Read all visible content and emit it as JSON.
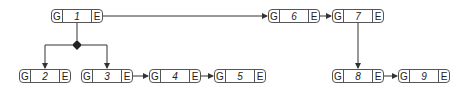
{
  "diagram": {
    "nodes": [
      {
        "id": "1",
        "label": "1",
        "left": "G",
        "right": "E",
        "x": 51,
        "y": 9
      },
      {
        "id": "2",
        "label": "2",
        "left": "G",
        "right": "E",
        "x": 19,
        "y": 69
      },
      {
        "id": "3",
        "label": "3",
        "left": "G",
        "right": "E",
        "x": 81,
        "y": 69
      },
      {
        "id": "4",
        "label": "4",
        "left": "G",
        "right": "E",
        "x": 149,
        "y": 69
      },
      {
        "id": "5",
        "label": "5",
        "left": "G",
        "right": "E",
        "x": 214,
        "y": 69
      },
      {
        "id": "6",
        "label": "6",
        "left": "G",
        "right": "E",
        "x": 268,
        "y": 9
      },
      {
        "id": "7",
        "label": "7",
        "left": "G",
        "right": "E",
        "x": 332,
        "y": 9
      },
      {
        "id": "8",
        "label": "8",
        "left": "G",
        "right": "E",
        "x": 332,
        "y": 69
      },
      {
        "id": "9",
        "label": "9",
        "left": "G",
        "right": "E",
        "x": 398,
        "y": 69
      }
    ],
    "edges": [
      {
        "from": "1",
        "to": "6"
      },
      {
        "from": "1",
        "to": "2",
        "via": "diamond"
      },
      {
        "from": "1",
        "to": "3",
        "via": "diamond"
      },
      {
        "from": "3",
        "to": "4"
      },
      {
        "from": "4",
        "to": "5"
      },
      {
        "from": "6",
        "to": "7"
      },
      {
        "from": "7",
        "to": "8"
      },
      {
        "from": "8",
        "to": "9"
      }
    ],
    "colors": {
      "line": "#333333",
      "border": "#555555"
    }
  }
}
